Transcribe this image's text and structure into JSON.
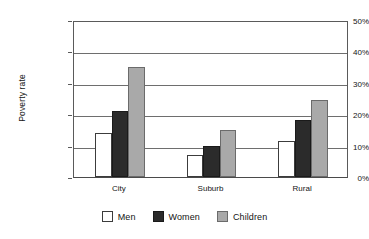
{
  "chart_data": {
    "type": "bar",
    "title": "",
    "xlabel": "",
    "ylabel": "Poverty rate",
    "categories": [
      "City",
      "Suburb",
      "Rural"
    ],
    "series": [
      {
        "name": "Men",
        "values": [
          14,
          7,
          11.5
        ],
        "color": "#ffffff"
      },
      {
        "name": "Women",
        "values": [
          21,
          10,
          18
        ],
        "color": "#2b2b2b"
      },
      {
        "name": "Children",
        "values": [
          35,
          15,
          24.5
        ],
        "color": "#a9a9a9"
      }
    ],
    "ylim": [
      0,
      50
    ],
    "y_ticks": [
      0,
      10,
      20,
      30,
      40,
      50
    ],
    "y_tick_labels": [
      "0%",
      "10%",
      "20%",
      "30%",
      "40%",
      "50%"
    ],
    "grid": true,
    "grid_axis": "y",
    "legend_position": "bottom",
    "annotations": []
  }
}
